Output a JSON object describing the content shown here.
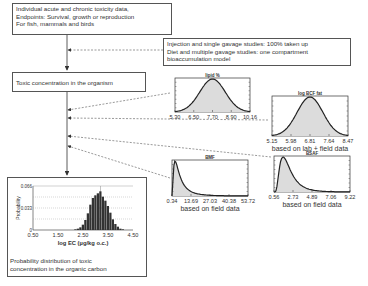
{
  "boxes": {
    "input_data": {
      "lines": [
        "Individual acute and chronic toxicity data,",
        "Endpoints: Survival, growth or reproduction",
        "For fish, mammals and birds"
      ]
    },
    "uptake_model": {
      "lines": [
        "Injection and single gavage studies: 100% taken up",
        "Diet and multiple gavage studies: one compartment",
        "bioaccumulation model"
      ]
    },
    "toxic_concentration": {
      "text": "Toxic concentration in the organism"
    },
    "result": {
      "lines": [
        "Probability distribution of toxic",
        "concentration in the organic carbon"
      ]
    }
  },
  "chart_data": [
    {
      "id": "lipid",
      "type": "area",
      "title": "lipid %",
      "distribution": "normal",
      "xticks": [
        "5.30",
        "6.50",
        "7.70",
        "8.90",
        "10.16"
      ],
      "xlim": [
        5.3,
        10.16
      ],
      "mode": 7.7,
      "caption": ""
    },
    {
      "id": "logbcf",
      "type": "area",
      "title": "log BCF fat",
      "distribution": "normal",
      "xticks": [
        "5.15",
        "5.98",
        "6.81",
        "7.64",
        "8.47"
      ],
      "xlim": [
        5.15,
        8.47
      ],
      "mode": 6.81,
      "caption": "based on lab + field data"
    },
    {
      "id": "bsaf",
      "type": "area",
      "title": "BSAF",
      "distribution": "lognormal",
      "xticks": [
        "0.56",
        "2.73",
        "4.89",
        "7.06",
        "9.22"
      ],
      "xlim": [
        0.56,
        9.22
      ],
      "mode": 1.6,
      "caption": "based on field data"
    },
    {
      "id": "bmf",
      "type": "area",
      "title": "BMF",
      "distribution": "lognormal",
      "xticks": [
        "0.34",
        "13.69",
        "27.03",
        "40.38",
        "53.72"
      ],
      "xlim": [
        0.34,
        53.72
      ],
      "mode": 2.5,
      "caption": "based on field data"
    },
    {
      "id": "result_hist",
      "type": "bar",
      "title": "",
      "xlabel": "log EC (µg/kg o.c.)",
      "ylabel": "Probability",
      "xticks": [
        "0.50",
        "1.50",
        "2.50",
        "3.50",
        "4.50"
      ],
      "yticks": [
        "0",
        "0.033",
        "0.066"
      ],
      "xlim": [
        0.5,
        4.5
      ],
      "ylim": [
        0,
        0.066
      ],
      "x": [
        2.2,
        2.3,
        2.4,
        2.5,
        2.6,
        2.7,
        2.8,
        2.9,
        3.0,
        3.1,
        3.2,
        3.3,
        3.4,
        3.5,
        3.6,
        3.7,
        3.8,
        3.9,
        4.0,
        4.1
      ],
      "values": [
        0.001,
        0.002,
        0.004,
        0.008,
        0.015,
        0.025,
        0.038,
        0.048,
        0.052,
        0.055,
        0.058,
        0.05,
        0.044,
        0.036,
        0.026,
        0.016,
        0.009,
        0.005,
        0.002,
        0.001
      ]
    }
  ]
}
